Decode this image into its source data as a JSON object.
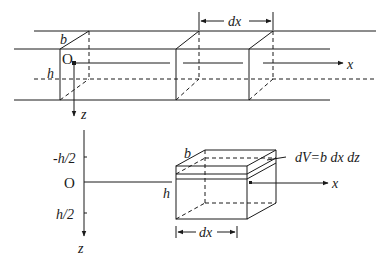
{
  "figure": {
    "top_view": {
      "labels": {
        "width": "b",
        "height": "h",
        "origin": "O",
        "x_axis": "x",
        "z_axis": "z",
        "segment_length": "dx"
      }
    },
    "bottom_view": {
      "labels": {
        "width": "b",
        "height": "h",
        "origin": "O",
        "x_axis": "x",
        "z_axis": "z",
        "top_coord": "-h/2",
        "bottom_coord": "h/2",
        "segment_length": "dx",
        "volume_element": "dV=b dx dz"
      }
    }
  }
}
